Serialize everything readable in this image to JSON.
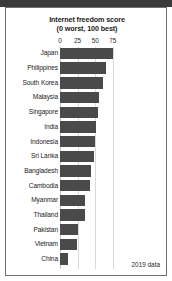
{
  "chart_data": {
    "type": "bar",
    "orientation": "horizontal",
    "title": "Internet freedom score",
    "subtitle": "(0 worst, 100 best)",
    "xlabel": "",
    "ylabel": "",
    "xlim": [
      0,
      80
    ],
    "ticks": [
      0,
      25,
      50,
      75
    ],
    "tick_labels": [
      "0",
      "25",
      "50",
      "75"
    ],
    "grid": true,
    "legend": "none",
    "annotation": "2019 data",
    "bar_color": "#4a4a4a",
    "categories": [
      "Japan",
      "Philippines",
      "South Korea",
      "Malaysia",
      "Singapore",
      "India",
      "Indonesia",
      "Sri Lanka",
      "Bangladesh",
      "Cambodia",
      "Myanmar",
      "Thailand",
      "Pakistan",
      "Vietnam",
      "China"
    ],
    "values": [
      75,
      66,
      61,
      56,
      54,
      51,
      50,
      49,
      44,
      43,
      36,
      35,
      26,
      24,
      11
    ]
  },
  "axis": {
    "tick_0": "0",
    "tick_25": "25",
    "tick_50": "75",
    "tick_labels": [
      "0",
      "25",
      "50",
      "75"
    ]
  },
  "rows": [
    {
      "label": "Japan",
      "value": 75
    },
    {
      "label": "Philippines",
      "value": 66
    },
    {
      "label": "South Korea",
      "value": 61
    },
    {
      "label": "Malaysia",
      "value": 56
    },
    {
      "label": "Singapore",
      "value": 54
    },
    {
      "label": "India",
      "value": 51
    },
    {
      "label": "Indonesia",
      "value": 50
    },
    {
      "label": "Sri Lanka",
      "value": 49
    },
    {
      "label": "Bangladesh",
      "value": 44
    },
    {
      "label": "Cambodia",
      "value": 43
    },
    {
      "label": "Myanmar",
      "value": 36
    },
    {
      "label": "Thailand",
      "value": 35
    },
    {
      "label": "Pakistan",
      "value": 26
    },
    {
      "label": "Vietnam",
      "value": 24
    },
    {
      "label": "China",
      "value": 11
    }
  ],
  "footer": {
    "note": "2019 data"
  }
}
